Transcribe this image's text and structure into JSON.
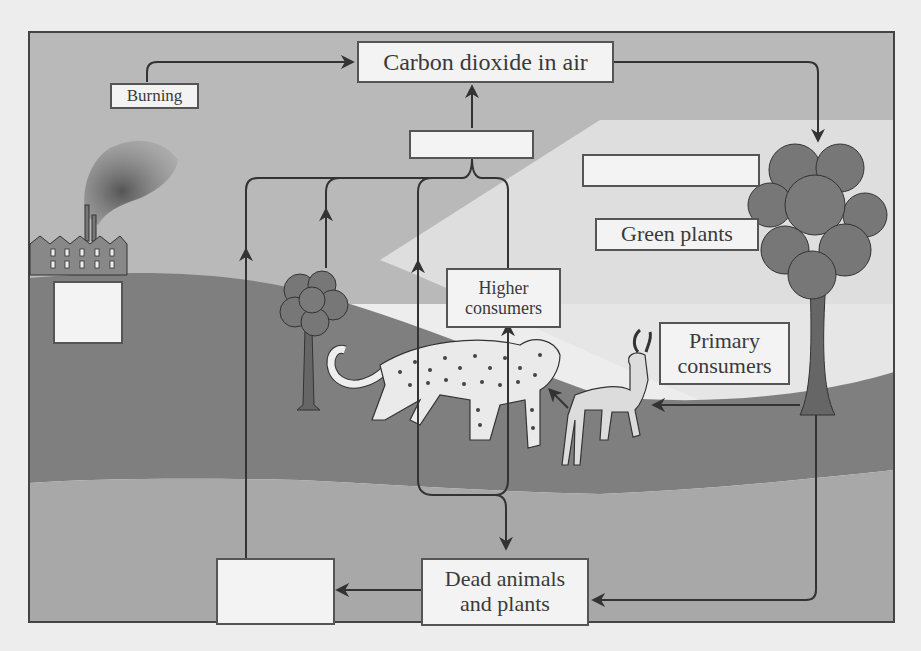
{
  "diagram": {
    "labels": {
      "carbon_dioxide": "Carbon dioxide in air",
      "burning": "Burning",
      "green_plants": "Green plants",
      "higher_consumers_line1": "Higher",
      "higher_consumers_line2": "consumers",
      "primary_consumers_line1": "Primary",
      "primary_consumers_line2": "consumers",
      "dead_line1": "Dead animals",
      "dead_line2": "and plants"
    },
    "blank_boxes": [
      {
        "id": "respiration-blank",
        "position": "below carbon dioxide box"
      },
      {
        "id": "photosynthesis-blank",
        "position": "left of large tree"
      },
      {
        "id": "fossil-fuels-blank",
        "position": "below factory"
      },
      {
        "id": "decomposers-blank",
        "position": "bottom left of dead animals box"
      }
    ],
    "illustrations": [
      "factory",
      "smoke",
      "small-tree",
      "large-tree",
      "leopard",
      "antelope"
    ],
    "colors": {
      "sky": "#b9b9b9",
      "hill": "#7f7f7f",
      "soil": "#a8a8a8",
      "foreground_light": "#e8e8e8",
      "arrow": "#333333",
      "box_fill": "#f3f3f3",
      "box_border": "#555555"
    }
  }
}
